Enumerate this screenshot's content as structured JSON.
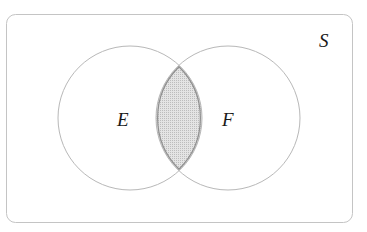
{
  "diagram": {
    "type": "venn",
    "universe": {
      "label": "S",
      "x": 6,
      "y": 14,
      "width": 346,
      "height": 208,
      "radius": 9,
      "stroke": "#c4c4c4"
    },
    "sets": [
      {
        "label": "E",
        "cx": 130,
        "cy": 118,
        "r": 72,
        "stroke": "#b8b8b8"
      },
      {
        "label": "F",
        "cx": 228,
        "cy": 118,
        "r": 72,
        "stroke": "#b8b8b8"
      }
    ],
    "shaded_region": {
      "description": "E ∩ F",
      "fill": "#d9d9d9",
      "stroke": "#8f8f8f"
    }
  },
  "labels": {
    "universe": "S",
    "set_e": "E",
    "set_f": "F"
  }
}
